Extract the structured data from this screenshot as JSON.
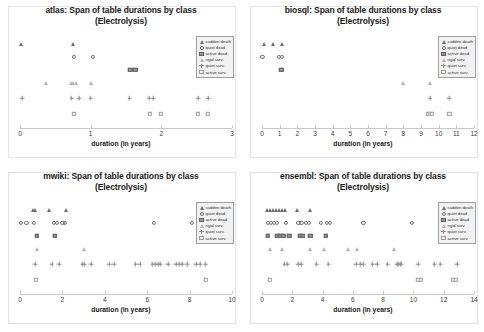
{
  "figure": {
    "title_suffix": "Span of table durations by class",
    "subtitle": "(Electrolysis)",
    "xlabel": "duration (in years)"
  },
  "legend": {
    "items": [
      {
        "label": "sudden death",
        "marker": "triangle-filled"
      },
      {
        "label": "quiet dead",
        "marker": "circle-open"
      },
      {
        "label": "active dead",
        "marker": "square-filled"
      },
      {
        "label": "rigid surv.",
        "marker": "triangle-open"
      },
      {
        "label": "quiet surv.",
        "marker": "plus"
      },
      {
        "label": "active surv.",
        "marker": "square-open"
      }
    ]
  },
  "chart_data": [
    {
      "type": "scatter",
      "name": "atlas",
      "title": "atlas: Span of table durations by class",
      "subtitle": "(Electrolysis)",
      "xlabel": "duration (in years)",
      "ylabel": "",
      "xlim": [
        0,
        3
      ],
      "xticks": [
        0,
        1,
        2,
        3
      ],
      "grid": false,
      "legend_position": "top-right",
      "series": [
        {
          "name": "sudden death",
          "marker": "triangle-filled",
          "level": 6,
          "x": [
            0.02,
            0.75
          ]
        },
        {
          "name": "quiet dead",
          "marker": "circle-open",
          "level": 5,
          "x": [
            0.76,
            1.03
          ]
        },
        {
          "name": "active dead",
          "marker": "square-filled",
          "level": 4,
          "x": [
            1.56,
            1.63
          ]
        },
        {
          "name": "rigid surv.",
          "marker": "triangle-open",
          "level": 3,
          "x": [
            0.37,
            0.72,
            0.75,
            0.79,
            1.0
          ]
        },
        {
          "name": "quiet surv.",
          "marker": "plus",
          "level": 2,
          "x": [
            0.03,
            0.73,
            0.84,
            1.0,
            1.55,
            1.83,
            1.89,
            2.52,
            2.66
          ]
        },
        {
          "name": "active surv.",
          "marker": "square-open",
          "level": 1,
          "x": [
            0.76,
            1.84,
            1.99,
            2.52,
            2.66
          ]
        }
      ]
    },
    {
      "type": "scatter",
      "name": "biosql",
      "title": "biosql: Span of table durations by class",
      "subtitle": "(Electrolysis)",
      "xlabel": "duration (in years)",
      "ylabel": "",
      "xlim": [
        0,
        12
      ],
      "xticks": [
        0,
        1,
        2,
        3,
        4,
        5,
        6,
        7,
        8,
        9,
        10,
        11,
        12
      ],
      "grid": false,
      "legend_position": "top-right",
      "series": [
        {
          "name": "sudden death",
          "marker": "triangle-filled",
          "level": 6,
          "x": [
            0.1,
            0.62,
            1.12
          ]
        },
        {
          "name": "quiet dead",
          "marker": "circle-open",
          "level": 5,
          "x": [
            0.02,
            0.95,
            1.12
          ]
        },
        {
          "name": "active dead",
          "marker": "square-filled",
          "level": 4,
          "x": [
            1.1
          ]
        },
        {
          "name": "rigid surv.",
          "marker": "triangle-open",
          "level": 3,
          "x": [
            8.0,
            9.5
          ]
        },
        {
          "name": "quiet surv.",
          "marker": "plus",
          "level": 2,
          "x": [
            9.5,
            10.6
          ]
        },
        {
          "name": "active surv.",
          "marker": "square-open",
          "level": 1,
          "x": [
            9.38,
            9.52,
            9.62,
            10.6
          ]
        }
      ]
    },
    {
      "type": "scatter",
      "name": "mwiki",
      "title": "mwiki: Span of table durations by class",
      "subtitle": "(Electrolysis)",
      "xlabel": "duration (in years)",
      "ylabel": "",
      "xlim": [
        0,
        10
      ],
      "xticks": [
        0,
        2,
        4,
        6,
        8,
        10
      ],
      "grid": false,
      "legend_position": "top-right",
      "series": [
        {
          "name": "sudden death",
          "marker": "triangle-filled",
          "level": 6,
          "x": [
            0.6,
            0.72,
            1.35,
            2.15
          ]
        },
        {
          "name": "quiet dead",
          "marker": "circle-open",
          "level": 5,
          "x": [
            0.05,
            0.3,
            0.65,
            1.6,
            1.75,
            2.0,
            2.1,
            6.3,
            8.1
          ]
        },
        {
          "name": "active dead",
          "marker": "square-filled",
          "level": 4,
          "x": [
            0.78,
            1.65
          ]
        },
        {
          "name": "rigid surv.",
          "marker": "triangle-open",
          "level": 3,
          "x": [
            0.78,
            3.0
          ]
        },
        {
          "name": "quiet surv.",
          "marker": "plus",
          "level": 2,
          "x": [
            0.72,
            1.5,
            1.85,
            2.95,
            3.05,
            3.35,
            4.2,
            4.45,
            5.45,
            5.65,
            6.25,
            6.4,
            6.5,
            6.6,
            7.0,
            7.35,
            7.5,
            7.65,
            7.9,
            8.3,
            8.5,
            8.75
          ]
        },
        {
          "name": "active surv.",
          "marker": "square-open",
          "level": 1,
          "x": [
            0.75,
            8.75
          ]
        }
      ]
    },
    {
      "type": "scatter",
      "name": "ensembl",
      "title": "ensembl: Span of table durations by class",
      "subtitle": "(Electrolysis)",
      "xlabel": "duration (in years)",
      "ylabel": "",
      "xlim": [
        0,
        14
      ],
      "xticks": [
        0,
        2,
        4,
        6,
        8,
        10,
        12,
        14
      ],
      "grid": false,
      "legend_position": "top-right",
      "series": [
        {
          "name": "sudden death",
          "marker": "triangle-filled",
          "level": 6,
          "x": [
            0.3,
            0.5,
            0.7,
            0.9,
            1.1,
            1.3,
            1.5,
            2.3,
            3.2
          ]
        },
        {
          "name": "quiet dead",
          "marker": "circle-open",
          "level": 5,
          "x": [
            0.4,
            0.6,
            0.8,
            1.0,
            1.6,
            2.4,
            2.6,
            2.9,
            3.1,
            3.9,
            4.3,
            4.5,
            6.7,
            9.9
          ]
        },
        {
          "name": "active dead",
          "marker": "square-filled",
          "level": 4,
          "x": [
            0.4,
            1.0,
            1.2,
            1.4,
            1.8,
            2.5,
            2.7,
            3.2,
            4.2
          ]
        },
        {
          "name": "rigid surv.",
          "marker": "triangle-open",
          "level": 3,
          "x": [
            0.5,
            1.3,
            3.2,
            4.1,
            5.7,
            6.3,
            8.7
          ]
        },
        {
          "name": "quiet surv.",
          "marker": "plus",
          "level": 2,
          "x": [
            1.5,
            1.7,
            2.4,
            2.6,
            3.6,
            4.4,
            6.2,
            6.5,
            6.7,
            7.3,
            7.6,
            8.3,
            8.9,
            9.0,
            9.1,
            9.2,
            10.3,
            11.4,
            11.8,
            12.9
          ]
        },
        {
          "name": "active surv.",
          "marker": "square-open",
          "level": 1,
          "x": [
            0.5,
            10.3,
            10.5,
            12.6,
            12.8
          ]
        }
      ]
    }
  ]
}
